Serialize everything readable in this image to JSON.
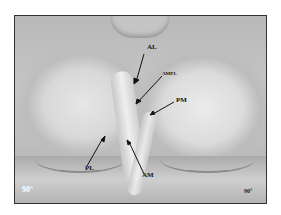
{
  "figure": {
    "labels": {
      "al": "AL",
      "ampl": "AMPL",
      "pm": "PM",
      "pl": "PL",
      "am": "AM"
    },
    "angle_left": "90°",
    "angle_right": "90°"
  }
}
